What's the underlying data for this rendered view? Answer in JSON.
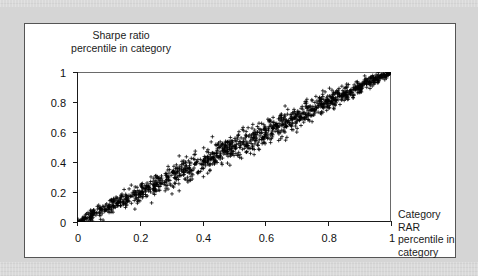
{
  "figure": {
    "background_color": "#d5d5d5",
    "panel_color": "#ffffff",
    "ink_color": "#111111"
  },
  "chart_data": {
    "type": "scatter",
    "title": "",
    "xlabel": "Category RAR\npercentile in\ncategory",
    "ylabel": "Sharpe ratio\npercentile in category",
    "xlim": [
      0,
      1
    ],
    "ylim": [
      0,
      1
    ],
    "grid": false,
    "legend": null,
    "marker": "+",
    "marker_color": "#000000",
    "n_points": 1400,
    "relationship": "near-perfect positive linear association along y = x",
    "xticks": [
      "0",
      "0.2",
      "0.4",
      "0.6",
      "0.8",
      "1"
    ],
    "xtick_values": [
      0,
      0.2,
      0.4,
      0.6,
      0.8,
      1
    ],
    "yticks": [
      "0",
      "0.2",
      "0.4",
      "0.6",
      "0.8",
      "1"
    ],
    "ytick_values": [
      0,
      0.2,
      0.4,
      0.6,
      0.8,
      1
    ],
    "fit_line": {
      "slope": 1,
      "intercept": 0
    },
    "scatter_spread": {
      "base_sigma": 0.035,
      "note": "band widest near the middle (x 0.3-0.7), tightening toward both ends"
    }
  }
}
